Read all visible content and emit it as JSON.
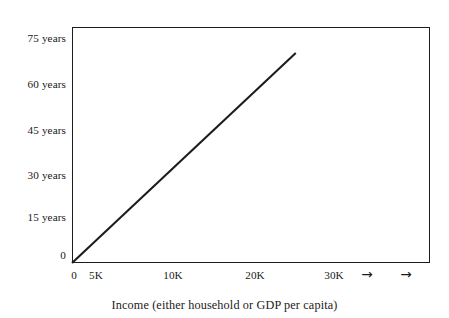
{
  "chart_data": {
    "type": "line",
    "title": "",
    "subtitle": "",
    "xlabel": "Income (either household or GDP per capita)",
    "ylabel": "",
    "xlim": [
      0,
      48000
    ],
    "ylim": [
      0,
      82
    ],
    "grid": false,
    "legend": null,
    "annotations": [],
    "x_ticks": [
      {
        "label": "0",
        "value": 0
      },
      {
        "label": "5K",
        "value": 5000
      },
      {
        "label": "10K",
        "value": 10000
      },
      {
        "label": "20K",
        "value": 20000
      },
      {
        "label": "30K",
        "value": 30000
      },
      {
        "label": "→",
        "value": 38500
      },
      {
        "label": "→",
        "value": 45500
      }
    ],
    "y_ticks": [
      {
        "label": "0",
        "value": 0
      },
      {
        "label": "15 years",
        "value": 15
      },
      {
        "label": "30 years",
        "value": 30
      },
      {
        "label": "45 years",
        "value": 45
      },
      {
        "label": "60 years",
        "value": 60
      },
      {
        "label": "75 years",
        "value": 75
      }
    ],
    "series": [
      {
        "name": "Life expectancy vs income",
        "color": "#1c1c1c",
        "x": [
          0,
          30000
        ],
        "y": [
          0,
          73
        ]
      }
    ]
  },
  "axis": {
    "x_title": "Income (either household or GDP per capita)"
  },
  "y_labels": {
    "t75": "75 years",
    "t60": "60 years",
    "t45": "45 years",
    "t30": "30 years",
    "t15": "15 years",
    "t0": "0"
  },
  "x_labels": {
    "t0": "0",
    "t5k": "5K",
    "t10k": "10K",
    "t20k": "20K",
    "t30k": "30K",
    "arrow1": "→",
    "arrow2": "→"
  }
}
